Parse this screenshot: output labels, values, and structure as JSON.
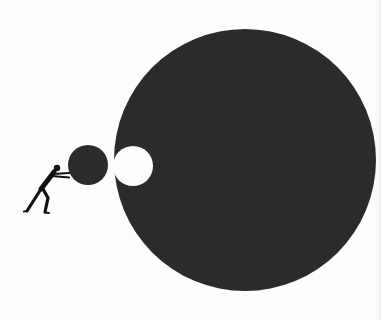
{
  "illustration": {
    "description": "Silhouette of a person pushing a small dark ball toward a large dark circle with a matching circular notch",
    "colors": {
      "background": "#fdfdfd",
      "shape_fill": "#2b2b2b",
      "notch_fill": "#fdfdfd",
      "figure_fill": "#111111"
    },
    "large_circle": {
      "cx": 245,
      "cy": 160,
      "r": 131
    },
    "notch_circle": {
      "cx": 133,
      "cy": 166,
      "r": 20
    },
    "small_ball": {
      "cx": 88,
      "cy": 165,
      "r": 20
    },
    "figure": {
      "head": {
        "cx": 57,
        "cy": 168,
        "r": 3.2
      }
    }
  }
}
